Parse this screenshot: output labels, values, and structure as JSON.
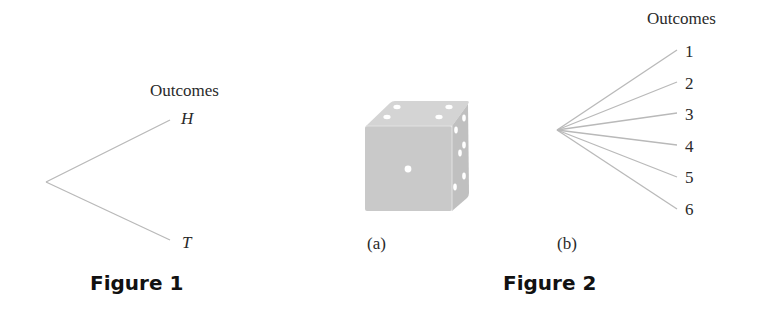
{
  "figure1": {
    "caption": "Figure 1",
    "header": "Outcomes",
    "outcomes": [
      "H",
      "T"
    ]
  },
  "figure2": {
    "caption": "Figure 2",
    "panel_a": {
      "label": "(a)",
      "image": "die-icon"
    },
    "panel_b": {
      "label": "(b)",
      "header": "Outcomes",
      "outcomes": [
        "1",
        "2",
        "3",
        "4",
        "5",
        "6"
      ]
    }
  },
  "colors": {
    "branch": "#b9b9b9",
    "die_face": "#c8c8c8",
    "die_top": "#d6d6d6",
    "die_side": "#bdbdbd",
    "pip": "#ffffff",
    "text": "#2a2a2a"
  }
}
